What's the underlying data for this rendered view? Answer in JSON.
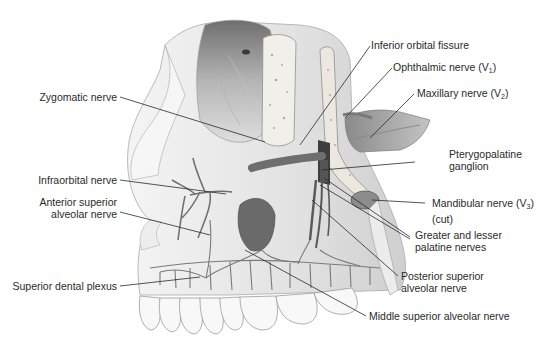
{
  "figure": {
    "type": "anatomical illustration",
    "colors": {
      "background": "#ffffff",
      "bone_light": "#eeeeee",
      "bone_mid": "#d6d6d6",
      "bone_dark": "#9a9a9a",
      "orbit_shadow": "#7c7c7c",
      "nerve": "#6e6e6e",
      "nerve_dark": "#4a4a4a",
      "leader_line": "#2a2a2a",
      "label_text": "#2a2a2a"
    }
  },
  "labels_left": [
    {
      "id": "zygomatic",
      "text": "Zygomatic nerve"
    },
    {
      "id": "infraorbital",
      "text": "Infraorbital nerve"
    },
    {
      "id": "asa_line1",
      "text": "Anterior superior"
    },
    {
      "id": "asa_line2",
      "text": "alveolar nerve"
    },
    {
      "id": "plexus",
      "text": "Superior dental plexus"
    }
  ],
  "labels_right": [
    {
      "id": "iof",
      "text": "Inferior orbital fissure"
    },
    {
      "id": "v1",
      "text": "Ophthalmic nerve (V",
      "sub": "1",
      "close": ")"
    },
    {
      "id": "v2",
      "text": "Maxillary nerve (V",
      "sub": "2",
      "close": ")"
    },
    {
      "id": "ptg_line1",
      "text": "Pterygopalatine"
    },
    {
      "id": "ptg_line2",
      "text": "ganglion"
    },
    {
      "id": "v3_line1",
      "text": "Mandibular nerve (V",
      "sub": "3",
      "close": ")"
    },
    {
      "id": "v3_line2",
      "text": "(cut)"
    },
    {
      "id": "pal_line1",
      "text": "Greater and lesser"
    },
    {
      "id": "pal_line2",
      "text": "palatine nerves"
    },
    {
      "id": "psa_line1",
      "text": "Posterior superior"
    },
    {
      "id": "psa_line2",
      "text": "alveolar nerve"
    },
    {
      "id": "msa",
      "text": "Middle superior alveolar nerve"
    }
  ]
}
